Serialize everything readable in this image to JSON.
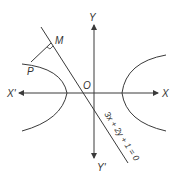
{
  "diagram": {
    "colors": {
      "stroke": "#3a3a3a",
      "label": "#333333",
      "background": "#ffffff"
    },
    "labels": {
      "x_positive": "X",
      "x_negative": "X'",
      "y_positive": "Y",
      "y_negative": "Y'",
      "origin": "O",
      "point_m": "M",
      "point_p": "P",
      "line_equation": "3x + 2y + 1 = 0"
    },
    "elements": [
      {
        "type": "axis",
        "name": "x-axis",
        "direction": "horizontal",
        "arrows": "both"
      },
      {
        "type": "axis",
        "name": "y-axis",
        "direction": "vertical",
        "arrows": "both"
      },
      {
        "type": "curve",
        "name": "hyperbola-left-branch"
      },
      {
        "type": "curve",
        "name": "hyperbola-right-branch"
      },
      {
        "type": "line",
        "name": "line-3x-2y-1",
        "equation": "3x + 2y + 1 = 0"
      },
      {
        "type": "segment",
        "name": "segment-pm",
        "from": "P",
        "to": "M",
        "perpendicular_to": "line-3x-2y-1"
      }
    ]
  }
}
